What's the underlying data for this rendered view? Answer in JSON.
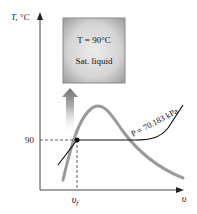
{
  "diagram": {
    "type": "T-v phase diagram",
    "y_axis": {
      "label": "T, °C"
    },
    "x_axis": {
      "label": "υ"
    },
    "tick_y": {
      "label": "90",
      "value": 90
    },
    "tick_x": {
      "label": "υ",
      "subscript": "f"
    },
    "state_box": {
      "line1": "T = 90°C",
      "line2": "Sat. liquid"
    },
    "isobar": {
      "label": "P = 70.183 kPa"
    },
    "colors": {
      "dome": "#9a9a9a",
      "isobar": "#111111",
      "axis": "#333333",
      "box_fill": "#a8a8a8",
      "box_center": "#e8e8e8",
      "arrow": "#7a7a7a"
    }
  }
}
